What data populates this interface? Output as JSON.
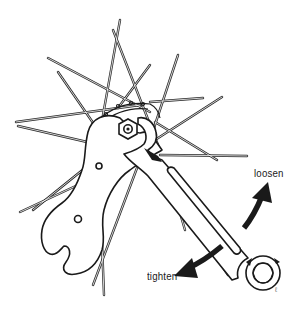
{
  "diagram": {
    "labels": {
      "loosen": "loosen",
      "tighten": "tighten"
    },
    "artist_mark": "ℓ",
    "colors": {
      "line": "#1a1a1a",
      "background": "#ffffff",
      "spoke_fill": "#ffffff"
    },
    "parts": [
      "spokes",
      "hub-flange",
      "axle-locknut",
      "cone-wrench",
      "combination-wrench",
      "loosen-arrow",
      "tighten-arrow"
    ]
  }
}
